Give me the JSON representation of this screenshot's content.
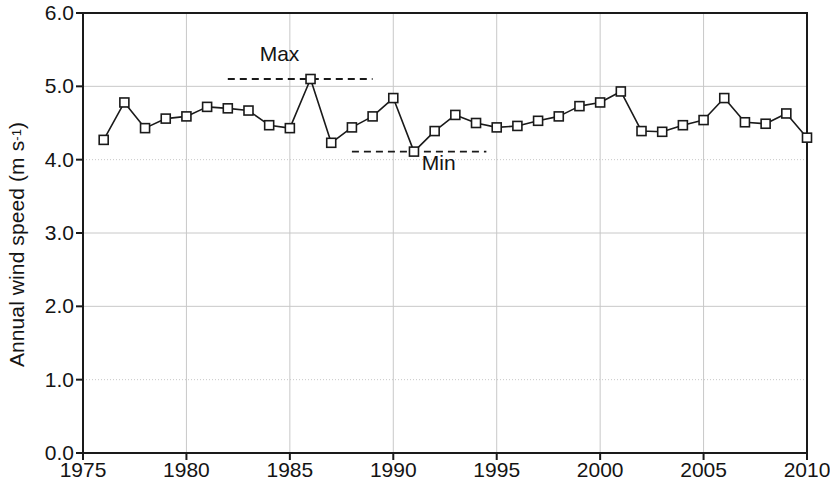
{
  "chart_data": {
    "type": "line",
    "title": "",
    "subtitle": "",
    "xlabel": "",
    "ylabel": "Annual wind speed (m s-1)",
    "ylabel_parts": {
      "main": "Annual wind speed (m s",
      "sup": "-1",
      "tail": ")"
    },
    "xlim": [
      1975,
      2010
    ],
    "ylim": [
      0.0,
      6.0
    ],
    "xticks": [
      1975,
      1980,
      1985,
      1990,
      1995,
      2000,
      2005,
      2010
    ],
    "xtick_labels": [
      "1975",
      "1980",
      "1985",
      "1990",
      "1995",
      "2000",
      "2005",
      "2010"
    ],
    "yticks": [
      0.0,
      1.0,
      2.0,
      3.0,
      4.0,
      5.0,
      6.0
    ],
    "ytick_labels": [
      "0.0",
      "1.0",
      "2.0",
      "3.0",
      "4.0",
      "5.0",
      "6.0"
    ],
    "grid": true,
    "grid_color": "#c8c8c8",
    "legend": null,
    "marker": "open-square",
    "line_color": "#1a1a1a",
    "marker_face_color": "#ffffff",
    "marker_edge_color": "#1a1a1a",
    "x": [
      1976,
      1977,
      1978,
      1979,
      1980,
      1981,
      1982,
      1983,
      1984,
      1985,
      1986,
      1987,
      1988,
      1989,
      1990,
      1991,
      1992,
      1993,
      1994,
      1995,
      1996,
      1997,
      1998,
      1999,
      2000,
      2001,
      2002,
      2003,
      2004,
      2005,
      2006,
      2007,
      2008,
      2009,
      2010
    ],
    "values": [
      4.27,
      4.78,
      4.43,
      4.56,
      4.59,
      4.72,
      4.7,
      4.67,
      4.47,
      4.43,
      5.1,
      4.23,
      4.44,
      4.59,
      4.84,
      4.11,
      4.39,
      4.61,
      4.5,
      4.44,
      4.46,
      4.53,
      4.59,
      4.73,
      4.78,
      4.93,
      4.39,
      4.38,
      4.47,
      4.54,
      4.84,
      4.51,
      4.49,
      4.63,
      4.3
    ],
    "series": [
      {
        "name": "Annual wind speed",
        "points": [
          {
            "year": 1976,
            "value": 4.27
          },
          {
            "year": 1977,
            "value": 4.78
          },
          {
            "year": 1978,
            "value": 4.43
          },
          {
            "year": 1979,
            "value": 4.56
          },
          {
            "year": 1980,
            "value": 4.59
          },
          {
            "year": 1981,
            "value": 4.72
          },
          {
            "year": 1982,
            "value": 4.7
          },
          {
            "year": 1983,
            "value": 4.67
          },
          {
            "year": 1984,
            "value": 4.47
          },
          {
            "year": 1985,
            "value": 4.43
          },
          {
            "year": 1986,
            "value": 5.1
          },
          {
            "year": 1987,
            "value": 4.23
          },
          {
            "year": 1988,
            "value": 4.44
          },
          {
            "year": 1989,
            "value": 4.59
          },
          {
            "year": 1990,
            "value": 4.84
          },
          {
            "year": 1991,
            "value": 4.11
          },
          {
            "year": 1992,
            "value": 4.39
          },
          {
            "year": 1993,
            "value": 4.61
          },
          {
            "year": 1994,
            "value": 4.5
          },
          {
            "year": 1995,
            "value": 4.44
          },
          {
            "year": 1996,
            "value": 4.46
          },
          {
            "year": 1997,
            "value": 4.53
          },
          {
            "year": 1998,
            "value": 4.59
          },
          {
            "year": 1999,
            "value": 4.73
          },
          {
            "year": 2000,
            "value": 4.78
          },
          {
            "year": 2001,
            "value": 4.93
          },
          {
            "year": 2002,
            "value": 4.39
          },
          {
            "year": 2003,
            "value": 4.38
          },
          {
            "year": 2004,
            "value": 4.47
          },
          {
            "year": 2005,
            "value": 4.54
          },
          {
            "year": 2006,
            "value": 4.84
          },
          {
            "year": 2007,
            "value": 4.51
          },
          {
            "year": 2008,
            "value": 4.49
          },
          {
            "year": 2009,
            "value": 4.63
          },
          {
            "year": 2010,
            "value": 4.3
          }
        ]
      }
    ],
    "annotations": [
      {
        "id": "max",
        "label": "Max",
        "value": 5.1,
        "year": 1986,
        "line_style": "dashed",
        "x_start": 1982.0,
        "x_end": 1989.0,
        "label_x": 1984.5,
        "label_y": 5.35,
        "label_anchor": "middle"
      },
      {
        "id": "min",
        "label": "Min",
        "value": 4.11,
        "year": 1991,
        "line_style": "dashed",
        "x_start": 1988.0,
        "x_end": 1994.5,
        "label_x": 1992.2,
        "label_y": 3.86,
        "label_anchor": "middle"
      }
    ]
  }
}
